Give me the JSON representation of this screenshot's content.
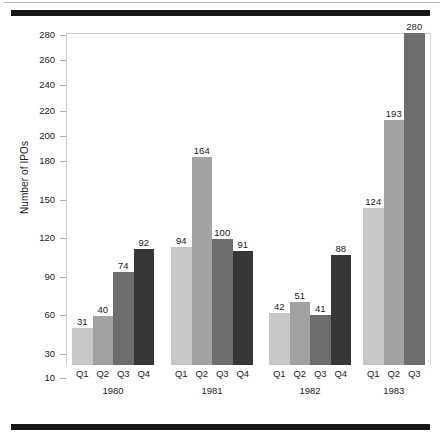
{
  "chart_data": {
    "type": "bar",
    "title": "",
    "xlabel": "",
    "ylabel": "Number of IPOs",
    "ylim": [
      0,
      290
    ],
    "grid": false,
    "legend": "none",
    "ytick_labels": [
      "10",
      "30",
      "60",
      "90",
      "120",
      "150",
      "180",
      "200",
      "220",
      "240",
      "260",
      "280"
    ],
    "ytick_values": [
      10,
      30,
      60,
      90,
      120,
      150,
      180,
      200,
      220,
      240,
      260,
      280
    ],
    "categories": [
      "Q1 1980",
      "Q2 1980",
      "Q3 1980",
      "Q4 1980",
      "Q1 1981",
      "Q2 1981",
      "Q3 1981",
      "Q4 1981",
      "Q1 1982",
      "Q2 1982",
      "Q3 1982",
      "Q4 1982",
      "Q1 1983",
      "Q2 1983",
      "Q3 1983"
    ],
    "values": [
      31,
      40,
      74,
      92,
      94,
      164,
      100,
      91,
      42,
      51,
      41,
      88,
      124,
      193,
      280
    ],
    "groups": [
      {
        "year": "1980",
        "quarters": [
          "Q1",
          "Q2",
          "Q3",
          "Q4"
        ],
        "values": [
          31,
          40,
          74,
          92
        ]
      },
      {
        "year": "1981",
        "quarters": [
          "Q1",
          "Q2",
          "Q3",
          "Q4"
        ],
        "values": [
          94,
          164,
          100,
          91
        ]
      },
      {
        "year": "1982",
        "quarters": [
          "Q1",
          "Q2",
          "Q3",
          "Q4"
        ],
        "values": [
          42,
          51,
          41,
          88
        ]
      },
      {
        "year": "1983",
        "quarters": [
          "Q1",
          "Q2",
          "Q3"
        ],
        "values": [
          124,
          193,
          280
        ]
      }
    ],
    "quarter_colors": {
      "Q1": "#c8c8c8",
      "Q2": "#a2a2a2",
      "Q3": "#6d6d6d",
      "Q4": "#363636"
    }
  },
  "colors": {
    "rule": "#161616",
    "frame": "#cfcfcf",
    "tick": "#b0b0b0",
    "text": "#1a1a1a",
    "background": "#ffffff"
  }
}
